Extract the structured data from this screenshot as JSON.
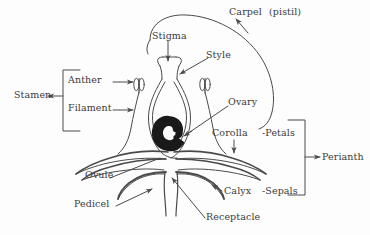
{
  "diagram": {
    "type": "botanical-cross-section",
    "background_color": "#fdfdfd",
    "line_color": "#4a4a4a",
    "fill_color": "#1a1a1a",
    "text_color": "#3b3b3b"
  },
  "labels": {
    "carpel": "Carpel",
    "pistil": "(pistil)",
    "stigma": "Stigma",
    "style": "Style",
    "ovary": "Ovary",
    "corolla": "Corolla",
    "petals": "-Petals",
    "perianth": "Perianth",
    "calyx": "Calyx",
    "sepals": "-Sepals",
    "receptacle": "Receptacle",
    "pedicel": "Pedicel",
    "ovule": "Ovule",
    "stamen": "Stamen",
    "anther": "Anther",
    "filament": "Filament"
  },
  "parts": [
    {
      "name": "carpel",
      "label": "Carpel",
      "note": "(pistil)",
      "side": "top-right"
    },
    {
      "name": "stigma",
      "label": "Stigma",
      "side": "top-center"
    },
    {
      "name": "style",
      "label": "Style",
      "side": "top-center"
    },
    {
      "name": "ovary",
      "label": "Ovary",
      "side": "center-right"
    },
    {
      "name": "ovule",
      "label": "Ovule",
      "side": "bottom-left"
    },
    {
      "name": "corolla",
      "label": "Corolla",
      "side": "center-right"
    },
    {
      "name": "calyx",
      "label": "Calyx",
      "side": "bottom-right"
    },
    {
      "name": "receptacle",
      "label": "Receptacle",
      "side": "bottom-center"
    },
    {
      "name": "pedicel",
      "label": "Pedicel",
      "side": "bottom-left"
    },
    {
      "name": "anther",
      "label": "Anther",
      "side": "left"
    },
    {
      "name": "filament",
      "label": "Filament",
      "side": "left"
    }
  ],
  "brackets": [
    {
      "name": "stamen",
      "label": "Stamen",
      "groups": [
        "Anther",
        "Filament"
      ],
      "side": "left"
    },
    {
      "name": "perianth",
      "label": "Perianth",
      "groups": [
        "-Petals",
        "-Sepals"
      ],
      "side": "right"
    }
  ]
}
